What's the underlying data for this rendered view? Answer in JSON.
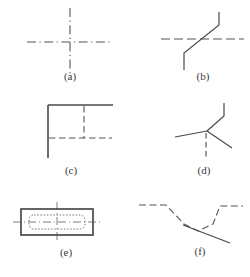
{
  "figure": {
    "type": "technical-line-drawing",
    "width": 250,
    "height": 277,
    "background_color": "#ffffff",
    "line_color": "#555555",
    "solid_line_color": "#4a4a4a",
    "caption_color": "#3a3a3a"
  },
  "captions": {
    "a": "(a)",
    "b": "(b)",
    "c": "(c)",
    "d": "(d)",
    "e": "(e)",
    "f": "(f)"
  },
  "panels": [
    {
      "id": "a",
      "label": "(a)",
      "content": "Dash-dot centerline cross: horizontal centerline crossed by vertical centerline, dashes meeting at the crossing point",
      "elements": [
        "horizontal-dashdot-line",
        "vertical-dashdot-line"
      ]
    },
    {
      "id": "b",
      "label": "(b)",
      "content": "Horizontal dashed line crossed by a jogged (offset) line made of two vertical solid segments joined by a diagonal",
      "elements": [
        "horizontal-dashed-line",
        "jogged-solid-line"
      ]
    },
    {
      "id": "c",
      "label": "(c)",
      "content": "Solid top horizontal edge and solid left vertical edge with a dashed vertical line and dashed horizontal line forming a hidden inner corner",
      "elements": [
        "solid-top-edge",
        "solid-left-edge",
        "dashed-vertical-line",
        "dashed-horizontal-line"
      ]
    },
    {
      "id": "d",
      "label": "(d)",
      "content": "Multiple lines converging at a single junction point: bent solid line from upper right, two solid diagonals to lower left and lower right, and a dashed vertical line going down",
      "elements": [
        "bent-solid-line",
        "diagonal-left-line",
        "diagonal-right-line",
        "dashed-vertical-line"
      ]
    },
    {
      "id": "e",
      "label": "(e)",
      "content": "Solid outer rectangle containing a finely dotted rounded inner rectangle, with horizontal and vertical centerlines crossing through the middle",
      "elements": [
        "solid-outer-rectangle",
        "dotted-inner-rounded-rectangle",
        "horizontal-centerline",
        "vertical-centerline"
      ]
    },
    {
      "id": "f",
      "label": "(f)",
      "content": "Dashed valley profile descending from left and rising to the right, crossed by a solid diagonal line running to the lower right",
      "elements": [
        "dashed-valley-line",
        "solid-diagonal-line"
      ]
    }
  ]
}
